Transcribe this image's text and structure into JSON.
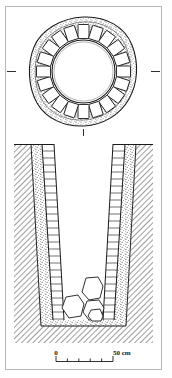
{
  "figure": {
    "kind": "archaeological-line-drawing",
    "ink_color": "#1a1a1a",
    "paper_color": "#ffffff",
    "frame_color": "#b9b9b9"
  },
  "plan": {
    "label": "plan-view",
    "description": "Circular stone-lined shaft seen from above",
    "outer_fill_pattern": "stipple",
    "lining_block_count": 20,
    "inner_opening_shape": "circle",
    "section_line_tick_left": "-",
    "section_line_tick_right": "-",
    "section_line_tick_bottom": "|"
  },
  "section": {
    "label": "section-view",
    "description": "Vertical cross-section of the shaft cut into subsoil",
    "ground_surface_label": "",
    "subsoil_pattern": "diagonal-hatch",
    "backfill_pattern": "stipple",
    "wall_pattern": "coursed-stone",
    "wall_course_count_left": 26,
    "wall_course_count_right": 26,
    "basal_rubble_stone_count": 4
  },
  "scalebar": {
    "label": "scale-bar",
    "start_label": "0",
    "end_label": "50 cm",
    "unit": "cm",
    "total_length_value": 50,
    "division_count": 5
  }
}
